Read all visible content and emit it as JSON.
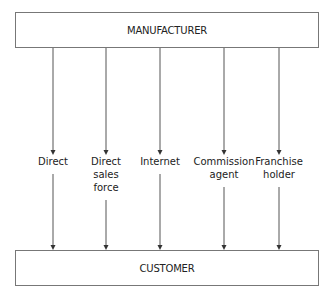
{
  "diagram": {
    "source": {
      "label": "MANUFACTURER"
    },
    "target": {
      "label": "CUSTOMER"
    },
    "channels": [
      {
        "lines": [
          "Direct"
        ]
      },
      {
        "lines": [
          "Direct",
          "sales",
          "force"
        ]
      },
      {
        "lines": [
          "Internet"
        ]
      },
      {
        "lines": [
          "Commission",
          "agent"
        ]
      },
      {
        "lines": [
          "Franchise",
          "holder"
        ]
      }
    ]
  }
}
